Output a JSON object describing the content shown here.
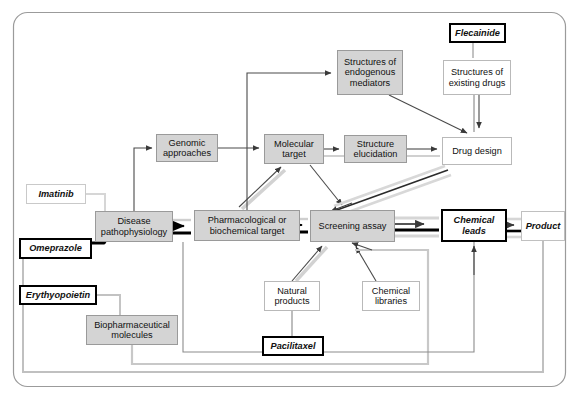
{
  "diagram": {
    "colors": {
      "node_fill_gray": "#d4d4d4",
      "node_fill_white": "#ffffff",
      "node_border_gray": "#9a9a9a",
      "arrow_dark": "#333333",
      "arrow_light": "#cccccc",
      "arrow_black": "#000000",
      "frame_border": "#9b9b9b"
    },
    "nodes": [
      {
        "id": "imatinib",
        "label": "Imatinib",
        "kind": "drug",
        "x": 26,
        "y": 184,
        "w": 60,
        "h": 20
      },
      {
        "id": "omeprazole",
        "label": "Omeprazole",
        "kind": "drugbold",
        "x": 19,
        "y": 238,
        "w": 73,
        "h": 21
      },
      {
        "id": "erythyopoietin",
        "label": "Erythyopoietin",
        "kind": "drugbold",
        "x": 19,
        "y": 285,
        "w": 78,
        "h": 20
      },
      {
        "id": "disease",
        "label": "Disease pathophysiology",
        "kind": "gray",
        "x": 95,
        "y": 211,
        "w": 78,
        "h": 31
      },
      {
        "id": "biopharma",
        "label": "Biopharmaceutical molecules",
        "kind": "gray",
        "x": 86,
        "y": 315,
        "w": 92,
        "h": 30
      },
      {
        "id": "genomic",
        "label": "Genomic approaches",
        "kind": "gray",
        "x": 156,
        "y": 134,
        "w": 62,
        "h": 28
      },
      {
        "id": "pharmtarget",
        "label": "Pharmacological or biochemical target",
        "kind": "gray",
        "x": 194,
        "y": 210,
        "w": 106,
        "h": 31
      },
      {
        "id": "moleculartarget",
        "label": "Molecular target",
        "kind": "gray",
        "x": 264,
        "y": 134,
        "w": 60,
        "h": 30
      },
      {
        "id": "endogenous",
        "label": "Structures of endogenous mediators",
        "kind": "gray",
        "x": 337,
        "y": 50,
        "w": 66,
        "h": 45
      },
      {
        "id": "structelucid",
        "label": "Structure elucidation",
        "kind": "gray",
        "x": 344,
        "y": 135,
        "w": 63,
        "h": 28
      },
      {
        "id": "existingdrugs",
        "label": "Structures of existing drugs",
        "kind": "white",
        "x": 443,
        "y": 60,
        "w": 68,
        "h": 35
      },
      {
        "id": "flecainide",
        "label": "Flecainide",
        "kind": "drugbold",
        "x": 449,
        "y": 23,
        "w": 57,
        "h": 20
      },
      {
        "id": "drugdesign",
        "label": "Drug design",
        "kind": "white",
        "x": 442,
        "y": 137,
        "w": 70,
        "h": 28
      },
      {
        "id": "screening",
        "label": "Screening assay",
        "kind": "gray",
        "x": 310,
        "y": 210,
        "w": 85,
        "h": 32
      },
      {
        "id": "chemleads",
        "label": "Chemical leads",
        "kind": "leadbox",
        "x": 441,
        "y": 209,
        "w": 66,
        "h": 33
      },
      {
        "id": "product",
        "label": "Product",
        "kind": "prodbox",
        "x": 521,
        "y": 211,
        "w": 44,
        "h": 30
      },
      {
        "id": "natural",
        "label": "Natural products",
        "kind": "white",
        "x": 264,
        "y": 281,
        "w": 56,
        "h": 30
      },
      {
        "id": "chemlibraries",
        "label": "Chemical libraries",
        "kind": "white",
        "x": 362,
        "y": 281,
        "w": 58,
        "h": 30
      },
      {
        "id": "pacilitaxel",
        "label": "Pacilitaxel",
        "kind": "drugbold",
        "x": 262,
        "y": 336,
        "w": 62,
        "h": 20
      }
    ],
    "edges": [
      {
        "from": "imatinib",
        "to": "disease",
        "style": "thin-light"
      },
      {
        "from": "omeprazole",
        "to": "disease",
        "style": "thick-black"
      },
      {
        "from": "erythyopoietin",
        "to": "biopharma",
        "style": "thin-light"
      },
      {
        "from": "disease",
        "to": "genomic",
        "style": "thin-dark-arrow"
      },
      {
        "from": "disease",
        "to": "pharmtarget",
        "style": "double-black"
      },
      {
        "from": "genomic",
        "to": "moleculartarget",
        "style": "thin-dark-arrow"
      },
      {
        "from": "pharmtarget",
        "to": "moleculartarget",
        "style": "thin-dark-arrow"
      },
      {
        "from": "pharmtarget",
        "to": "endogenous",
        "style": "thin-dark-arrow"
      },
      {
        "from": "pharmtarget",
        "to": "screening",
        "style": "double-black"
      },
      {
        "from": "moleculartarget",
        "to": "structelucid",
        "style": "thin-dark-arrow"
      },
      {
        "from": "moleculartarget",
        "to": "screening",
        "style": "thin-dark-arrow"
      },
      {
        "from": "moleculartarget",
        "to": "drugdesign",
        "style": "thin-light"
      },
      {
        "from": "structelucid",
        "to": "drugdesign",
        "style": "thin-dark-arrow"
      },
      {
        "from": "endogenous",
        "to": "drugdesign",
        "style": "thin-dark-arrow"
      },
      {
        "from": "flecainide",
        "to": "existingdrugs",
        "style": "thin-light"
      },
      {
        "from": "existingdrugs",
        "to": "drugdesign",
        "style": "thin-dark-arrow"
      },
      {
        "from": "drugdesign",
        "to": "screening",
        "style": "triple-band"
      },
      {
        "from": "natural",
        "to": "screening",
        "style": "thin-dark-arrow"
      },
      {
        "from": "chemlibraries",
        "to": "screening",
        "style": "thin-dark-arrow"
      },
      {
        "from": "pacilitaxel",
        "to": "natural",
        "style": "thin-light"
      },
      {
        "from": "biopharma",
        "to": "screening",
        "style": "thin-light-feedback"
      },
      {
        "from": "screening",
        "to": "chemleads",
        "style": "triple-band"
      },
      {
        "from": "chemleads",
        "to": "product",
        "style": "triple-band"
      },
      {
        "from": "chemleads",
        "to": "disease",
        "style": "feedback-loop"
      },
      {
        "from": "product",
        "to": "disease",
        "style": "feedback-loop"
      }
    ]
  }
}
